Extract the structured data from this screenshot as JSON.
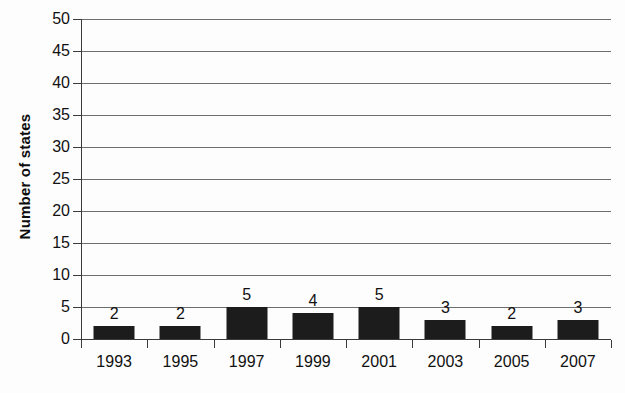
{
  "chart_data": {
    "type": "bar",
    "title": "",
    "subtitle": "",
    "xlabel": "",
    "ylabel": "Number of states",
    "categories": [
      "1993",
      "1995",
      "1997",
      "1999",
      "2001",
      "2003",
      "2005",
      "2007"
    ],
    "values": [
      2,
      2,
      5,
      4,
      5,
      3,
      2,
      3
    ],
    "value_labels": [
      "2",
      "2",
      "5",
      "4",
      "5",
      "3",
      "2",
      "3"
    ],
    "ylim": [
      0,
      50
    ],
    "ytick_step": 5,
    "ytick_labels": [
      "0",
      "5",
      "10",
      "15",
      "20",
      "25",
      "30",
      "35",
      "40",
      "45",
      "50"
    ],
    "grid": true,
    "grid_axis": "y",
    "legend": null,
    "legend_position": "none",
    "bar_color": "#1c1c1c",
    "gridline_color": "#6d6d6d",
    "axis_color": "#3a3a3a",
    "background_color": "#fdfdfd",
    "annotations": []
  }
}
